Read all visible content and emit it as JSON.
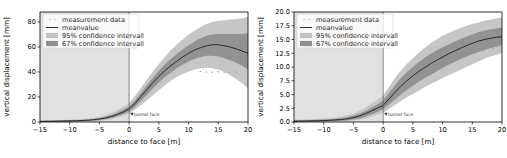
{
  "figure": {
    "panels": [
      {
        "id": "left",
        "legend": {
          "items": [
            {
              "label": "measurement data",
              "marker": "dots",
              "color": "#b0b0b0"
            },
            {
              "label": "meanvalue",
              "marker": "line",
              "color": "#2b2b2b"
            },
            {
              "label": "95% confidence intervall",
              "marker": "patch",
              "color": "#c3c3c3"
            },
            {
              "label": "67% confidence intervall",
              "marker": "patch",
              "color": "#8f8f8f"
            }
          ]
        },
        "annotation": {
          "text": "tunnel face",
          "x": 0
        },
        "chart_data": {
          "type": "line",
          "title": "",
          "xlabel": "distance to face [m]",
          "ylabel": "vertical displacement [mm]",
          "xlim": [
            -15,
            20
          ],
          "ylim": [
            0,
            88
          ],
          "xticks": [
            -15,
            -10,
            -5,
            0,
            5,
            10,
            15,
            20
          ],
          "xticklabels": [
            "−15",
            "−10",
            "−5",
            "0",
            "5",
            "10",
            "15",
            "20"
          ],
          "yticks": [
            0,
            20,
            40,
            60,
            80
          ],
          "yticklabels": [
            "0",
            "20",
            "40",
            "60",
            "80"
          ],
          "grid": false,
          "legend_position": "upper left",
          "x": [
            -15,
            -13,
            -11,
            -9,
            -7,
            -6,
            -5,
            -4,
            -3,
            -2,
            -1,
            0,
            1,
            2,
            3,
            4,
            5,
            6,
            7,
            8,
            9,
            10,
            11,
            12,
            13,
            14,
            15,
            16,
            17,
            18,
            19,
            20
          ],
          "series": [
            {
              "name": "meanvalue",
              "values": [
                0.5,
                0.6,
                0.8,
                1.0,
                1.4,
                1.8,
                2.4,
                3.2,
                4.4,
                6.0,
                8.0,
                10.5,
                15.0,
                20.5,
                26.0,
                31.5,
                36.5,
                41.0,
                45.0,
                48.5,
                52.0,
                55.0,
                57.5,
                59.5,
                61.0,
                61.8,
                61.8,
                61.0,
                60.0,
                58.5,
                56.8,
                55.0
              ]
            },
            {
              "name": "95% upper",
              "values": [
                1.2,
                1.4,
                1.7,
                2.1,
                2.8,
                3.4,
                4.2,
                5.4,
                7.0,
                9.2,
                12.0,
                15.0,
                21.0,
                27.5,
                34.0,
                40.5,
                46.5,
                52.0,
                57.5,
                62.0,
                66.0,
                70.0,
                73.0,
                76.0,
                78.5,
                80.0,
                81.0,
                81.5,
                82.0,
                82.5,
                83.0,
                84.0
              ]
            },
            {
              "name": "95% lower",
              "values": [
                0.0,
                0.0,
                0.1,
                0.2,
                0.4,
                0.6,
                0.9,
                1.4,
                2.2,
                3.4,
                5.0,
                6.8,
                10.0,
                13.5,
                17.5,
                21.5,
                25.5,
                29.5,
                33.0,
                36.0,
                38.5,
                40.5,
                42.0,
                43.0,
                43.5,
                43.0,
                42.0,
                40.0,
                37.5,
                34.5,
                31.0,
                27.0
              ]
            },
            {
              "name": "67% upper",
              "values": [
                0.9,
                1.0,
                1.2,
                1.5,
                2.0,
                2.5,
                3.2,
                4.2,
                5.6,
                7.4,
                9.8,
                12.5,
                17.5,
                23.5,
                29.5,
                35.5,
                41.0,
                46.0,
                50.5,
                54.5,
                58.0,
                61.5,
                64.5,
                67.0,
                69.0,
                70.0,
                70.5,
                70.5,
                70.5,
                70.5,
                70.5,
                71.0
              ]
            },
            {
              "name": "67% lower",
              "values": [
                0.1,
                0.2,
                0.3,
                0.5,
                0.8,
                1.1,
                1.6,
                2.3,
                3.3,
                4.6,
                6.3,
                8.4,
                12.4,
                17.0,
                22.0,
                27.0,
                31.5,
                36.0,
                39.5,
                43.0,
                46.0,
                48.5,
                50.5,
                52.0,
                53.0,
                53.0,
                52.5,
                51.0,
                49.5,
                47.5,
                45.0,
                42.0
              ]
            }
          ],
          "scatter": {
            "name": "measurement data",
            "x": [
              12.0,
              13.0,
              14.0,
              15.0,
              16.0,
              17.0,
              18.0
            ],
            "y": [
              40.5,
              40.0,
              39.8,
              40.2,
              40.0,
              39.5,
              39.8
            ]
          }
        }
      },
      {
        "id": "right",
        "legend": {
          "items": [
            {
              "label": "measurement data",
              "marker": "dots",
              "color": "#b0b0b0"
            },
            {
              "label": "meanvalue",
              "marker": "line",
              "color": "#2b2b2b"
            },
            {
              "label": "95% confidence intervall",
              "marker": "patch",
              "color": "#c3c3c3"
            },
            {
              "label": "67% confidence intervall",
              "marker": "patch",
              "color": "#8f8f8f"
            }
          ]
        },
        "annotation": {
          "text": "tunnel face",
          "x": 0
        },
        "chart_data": {
          "type": "line",
          "title": "",
          "xlabel": "distance to face [m]",
          "ylabel": "vertical displacement [mm]",
          "xlim": [
            -15,
            20
          ],
          "ylim": [
            0,
            20
          ],
          "xticks": [
            -15,
            -10,
            -5,
            0,
            5,
            10,
            15,
            20
          ],
          "xticklabels": [
            "−15",
            "−10",
            "−5",
            "0",
            "5",
            "10",
            "15",
            "20"
          ],
          "yticks": [
            0,
            2.5,
            5,
            7.5,
            10,
            12.5,
            15,
            17.5,
            20
          ],
          "yticklabels": [
            "0.0",
            "2.5",
            "5.0",
            "7.5",
            "10.0",
            "12.5",
            "15.0",
            "17.5",
            "20.0"
          ],
          "grid": false,
          "legend_position": "upper left",
          "x": [
            -15,
            -13,
            -11,
            -9,
            -7,
            -6,
            -5,
            -4,
            -3,
            -2,
            -1,
            0,
            1,
            2,
            3,
            4,
            5,
            6,
            7,
            8,
            9,
            10,
            11,
            12,
            13,
            14,
            15,
            16,
            17,
            18,
            19,
            20
          ],
          "series": [
            {
              "name": "meanvalue",
              "values": [
                0.15,
                0.18,
                0.22,
                0.3,
                0.45,
                0.6,
                0.8,
                1.1,
                1.5,
                2.0,
                2.5,
                3.0,
                4.2,
                5.4,
                6.5,
                7.5,
                8.4,
                9.2,
                9.9,
                10.6,
                11.2,
                11.8,
                12.4,
                12.9,
                13.4,
                13.9,
                14.3,
                14.7,
                15.0,
                15.2,
                15.4,
                15.5
              ]
            },
            {
              "name": "95% upper",
              "values": [
                0.4,
                0.45,
                0.55,
                0.7,
                0.95,
                1.2,
                1.5,
                2.0,
                2.6,
                3.3,
                4.0,
                4.8,
                6.4,
                8.0,
                9.4,
                10.6,
                11.6,
                12.6,
                13.5,
                14.3,
                15.0,
                15.7,
                16.2,
                16.7,
                17.1,
                17.5,
                17.8,
                18.1,
                18.4,
                18.6,
                18.8,
                19.0
              ]
            },
            {
              "name": "95% lower",
              "values": [
                0.0,
                0.02,
                0.04,
                0.07,
                0.13,
                0.18,
                0.26,
                0.4,
                0.6,
                0.9,
                1.3,
                1.7,
                2.4,
                3.1,
                3.8,
                4.5,
                5.1,
                5.7,
                6.3,
                6.9,
                7.4,
                8.0,
                8.5,
                9.0,
                9.5,
                10.0,
                10.5,
                11.0,
                11.5,
                11.9,
                12.2,
                12.5
              ]
            },
            {
              "name": "67% upper",
              "values": [
                0.28,
                0.32,
                0.4,
                0.5,
                0.7,
                0.9,
                1.15,
                1.5,
                2.0,
                2.6,
                3.2,
                3.9,
                5.3,
                6.7,
                8.0,
                9.1,
                10.0,
                10.9,
                11.7,
                12.4,
                13.0,
                13.6,
                14.1,
                14.6,
                15.1,
                15.5,
                15.9,
                16.3,
                16.6,
                16.8,
                17.0,
                17.2
              ]
            },
            {
              "name": "67% lower",
              "values": [
                0.05,
                0.07,
                0.1,
                0.15,
                0.25,
                0.33,
                0.45,
                0.65,
                0.95,
                1.35,
                1.8,
                2.3,
                3.2,
                4.1,
                5.0,
                5.8,
                6.6,
                7.3,
                8.0,
                8.6,
                9.2,
                9.8,
                10.4,
                10.9,
                11.4,
                11.9,
                12.3,
                12.7,
                13.1,
                13.4,
                13.7,
                13.9
              ]
            }
          ],
          "scatter": {
            "name": "measurement data",
            "x": [
              8.0,
              9.5,
              11.0,
              12.5,
              14.0,
              15.5,
              17.0,
              18.5
            ],
            "y": [
              9.6,
              10.2,
              10.8,
              11.4,
              12.0,
              12.6,
              13.0,
              13.4
            ]
          }
        }
      }
    ],
    "colors": {
      "ci95": "#c3c3c3",
      "ci67": "#8f8f8f",
      "mean": "#2b2b2b",
      "prefaceShade": "#c8c8c8",
      "background": "#ffffff"
    }
  }
}
